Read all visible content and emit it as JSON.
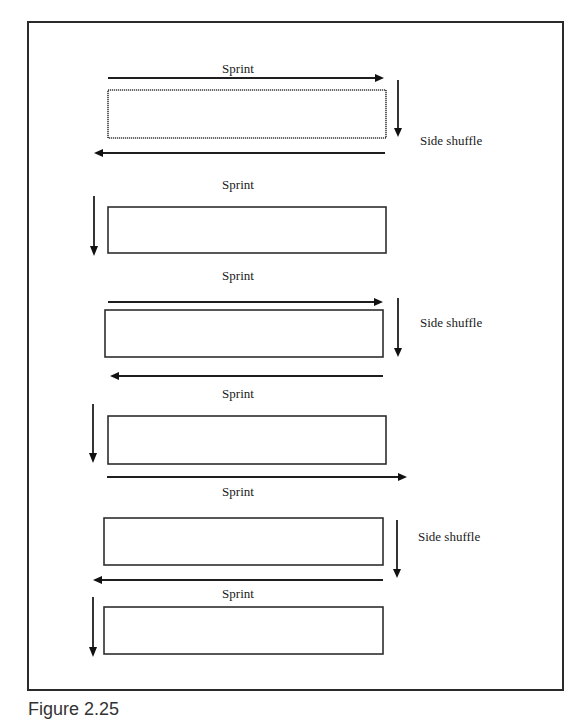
{
  "figure": {
    "caption": "Figure 2.25",
    "frame": {
      "x": 28,
      "y": 22,
      "w": 535,
      "h": 668
    },
    "colors": {
      "stroke": "#1e1e1e",
      "background": "#ffffff"
    }
  },
  "labels": {
    "sprint": "Sprint",
    "side_shuffle": "Side shuffle"
  },
  "rows": [
    {
      "sprint_label": "Sprint",
      "box": {
        "x": 108,
        "y": 90,
        "w": 278,
        "h": 48
      },
      "sprint_arrow": "right",
      "side_shuffle_label": "Side shuffle",
      "turn_arrow_side": "right"
    },
    {
      "sprint_label": "Sprint",
      "box": {
        "x": 108,
        "y": 207,
        "w": 278,
        "h": 46
      },
      "sprint_arrow": "left",
      "turn_arrow_side": "left"
    },
    {
      "sprint_label": "Sprint",
      "box": {
        "x": 105,
        "y": 310,
        "w": 278,
        "h": 47
      },
      "sprint_arrow": "right",
      "side_shuffle_label": "Side shuffle",
      "turn_arrow_side": "right"
    },
    {
      "sprint_label": "Sprint",
      "box": {
        "x": 108,
        "y": 416,
        "w": 278,
        "h": 48
      },
      "sprint_arrow": "left",
      "turn_arrow_side": "left"
    },
    {
      "sprint_label": "Sprint",
      "box": {
        "x": 104,
        "y": 518,
        "w": 279,
        "h": 47
      },
      "sprint_arrow": "right",
      "side_shuffle_label": "Side shuffle",
      "turn_arrow_side": "right"
    },
    {
      "sprint_label": "Sprint",
      "box": {
        "x": 104,
        "y": 607,
        "w": 279,
        "h": 47
      },
      "sprint_arrow": "left",
      "turn_arrow_side": "left"
    }
  ]
}
